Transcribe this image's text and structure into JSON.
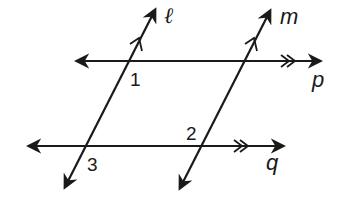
{
  "diagram": {
    "lines": {
      "l": {
        "label": "ℓ",
        "role": "transversal",
        "parallel_mark": "single"
      },
      "m": {
        "label": "m",
        "role": "transversal",
        "parallel_mark": "single"
      },
      "p": {
        "label": "p",
        "role": "parallel line",
        "parallel_mark": "double"
      },
      "q": {
        "label": "q",
        "role": "parallel line",
        "parallel_mark": "double"
      }
    },
    "angles": {
      "a1": {
        "label": "1",
        "at": "intersection of l and p"
      },
      "a2": {
        "label": "2",
        "at": "intersection of m and q"
      },
      "a3": {
        "label": "3",
        "at": "intersection of l and q"
      }
    },
    "color": "#1a1a1a"
  }
}
